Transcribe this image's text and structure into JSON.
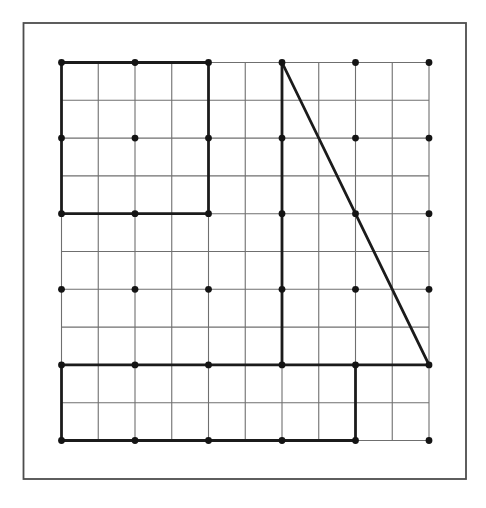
{
  "figure": {
    "canvas": {
      "width": 486,
      "height": 508,
      "background": "#ffffff"
    },
    "frame": {
      "x": 23.5,
      "y": 23,
      "width": 442.5,
      "height": 456,
      "stroke": "#4d4d4d",
      "stroke_width": 1.8
    },
    "grid": {
      "x0": 61.5,
      "y0": 62.5,
      "cols": 10,
      "rows": 10,
      "cell_width": 36.75,
      "cell_height": 37.8,
      "line_color": "#6f6f6f",
      "line_width": 1.1
    },
    "dots": {
      "step": 2,
      "radius": 3.4,
      "color": "#141414"
    },
    "bold": {
      "color": "#1b1b1b",
      "width": 2.8,
      "segments": [
        {
          "name": "square-top",
          "x1": 0,
          "y1": 0,
          "x2": 4,
          "y2": 0
        },
        {
          "name": "square-left",
          "x1": 0,
          "y1": 0,
          "x2": 0,
          "y2": 4
        },
        {
          "name": "square-bottom",
          "x1": 0,
          "y1": 4,
          "x2": 4,
          "y2": 4
        },
        {
          "name": "square-right",
          "x1": 4,
          "y1": 0,
          "x2": 4,
          "y2": 4
        },
        {
          "name": "triangle-vertical-leg",
          "x1": 6,
          "y1": 0,
          "x2": 6,
          "y2": 8
        },
        {
          "name": "triangle-hypotenuse",
          "x1": 6,
          "y1": 0,
          "x2": 10,
          "y2": 8
        },
        {
          "name": "long-horizontal-line",
          "x1": 0,
          "y1": 8,
          "x2": 10,
          "y2": 8
        },
        {
          "name": "rectangle-left",
          "x1": 0,
          "y1": 8,
          "x2": 0,
          "y2": 10
        },
        {
          "name": "rectangle-bottom",
          "x1": 0,
          "y1": 10,
          "x2": 8,
          "y2": 10
        },
        {
          "name": "rectangle-right",
          "x1": 8,
          "y1": 8,
          "x2": 8,
          "y2": 10
        }
      ]
    }
  }
}
